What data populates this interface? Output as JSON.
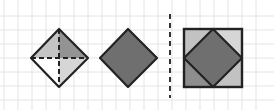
{
  "diagram": {
    "grid": {
      "spacing": 14,
      "color": "#e2e2e2",
      "x_start": 4,
      "y_start": 2
    },
    "colors": {
      "outline": "#222222",
      "dark_fill": "#6e6e6e",
      "mid_fill": "#8f8f8f",
      "light_fill": "#c4c4c4",
      "very_light_fill": "#d8d8d8",
      "white_fill": "#ffffff"
    },
    "figures": [
      {
        "name": "split-diamond",
        "top": [
          59,
          29
        ],
        "right": [
          88,
          58
        ],
        "bottom": [
          59,
          87
        ],
        "left": [
          31,
          58
        ],
        "quadrants": {
          "top_left": "light",
          "top_right": "mid",
          "bottom_left": "white",
          "bottom_right": "very_light"
        },
        "internal_lines": "dashed"
      },
      {
        "name": "solid-diamond",
        "top": [
          128,
          29
        ],
        "right": [
          157,
          58
        ],
        "bottom": [
          128,
          87
        ],
        "left": [
          100,
          58
        ],
        "fill": "dark"
      },
      {
        "name": "dashed-divider",
        "x": 170,
        "y1": 14,
        "y2": 98
      },
      {
        "name": "square-with-inscribed-diamond",
        "square": {
          "x": 184,
          "y": 29,
          "w": 58,
          "h": 58
        },
        "diamond": {
          "top": [
            213,
            29
          ],
          "right": [
            242,
            58
          ],
          "bottom": [
            213,
            87
          ],
          "left": [
            184,
            58
          ]
        },
        "corner_fills": {
          "top_left": "light",
          "top_right": "very_light",
          "bottom_left": "mid",
          "bottom_right": "light"
        },
        "diamond_fill": "dark"
      }
    ]
  }
}
